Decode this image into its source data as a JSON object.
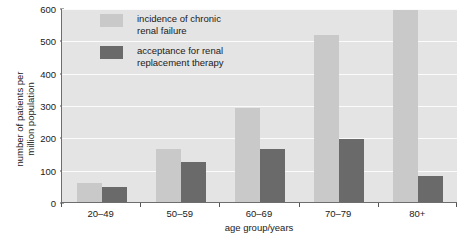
{
  "chart_data": {
    "type": "bar",
    "title": "",
    "subtitle": "",
    "xlabel": "age group/years",
    "ylabel": "number of patients per\nmillion population",
    "categories": [
      "20–49",
      "50–59",
      "60–69",
      "70–79",
      "80+"
    ],
    "series": [
      {
        "name": "incidence of chronic\nrenal failure",
        "color": "#c9c9c9",
        "values": [
          60,
          165,
          290,
          515,
          595
        ]
      },
      {
        "name": "acceptance for renal\nreplacement therapy",
        "color": "#6a6a6a",
        "values": [
          45,
          125,
          165,
          195,
          80
        ]
      }
    ],
    "ylim": [
      0,
      600
    ],
    "yticks": [
      0,
      100,
      200,
      300,
      400,
      500,
      600
    ],
    "ytick_labels": [
      "0",
      "100",
      "200",
      "300",
      "400",
      "500",
      "600"
    ],
    "grid": "horizontal",
    "gridline_color": "#fbfbfb",
    "plot_background": "#e4e4e4",
    "axis_color": "#6d6d6d",
    "legend_position": "inside-top-left"
  }
}
